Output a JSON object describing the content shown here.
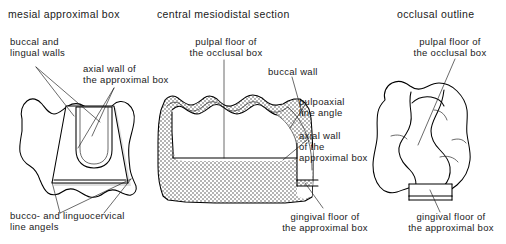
{
  "figure": {
    "kind": "dental-cavity-preparation-diagram",
    "background_color": "#ffffff",
    "line_color": "#000000",
    "hatch_color": "#b0b0b0"
  },
  "panels": {
    "left": {
      "title": "mesial approximal box",
      "labels": {
        "buccal_lingual_walls": "buccal and\nlingual walls",
        "axial_wall": "axial wall of\nthe approximal box",
        "line_angels": "bucco- and linguocervical\nline angels"
      }
    },
    "center": {
      "title": "central mesiodistal section",
      "labels": {
        "pulpal_floor": "pulpal floor of\nthe occlusal box",
        "buccal_wall": "buccal wall",
        "pulpoaxial": "pulpoaxial\nline angle",
        "axial_wall": "axial wall\nof the\napproximal box",
        "gingival_floor": "gingival floor of\nthe approximal box"
      }
    },
    "right": {
      "title": "occlusal outline",
      "labels": {
        "pulpal_floor": "pulpal floor of\nthe occlusal box",
        "gingival_floor": "gingival floor of\nthe approximal box"
      }
    }
  }
}
